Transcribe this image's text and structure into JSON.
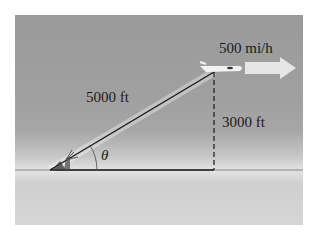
{
  "diagram": {
    "hypotenuse_label": "5000 ft",
    "height_label": "3000 ft",
    "speed_label": "500 mi/h",
    "angle_label": "θ",
    "colors": {
      "line": "#1a1a1a",
      "arrow": "#e8e8e8",
      "plane": "#f0f0f0"
    }
  }
}
